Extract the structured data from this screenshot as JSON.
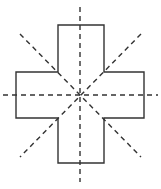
{
  "figure": {
    "shape_name": "cross",
    "background_color": "#ffffff",
    "canvas": {
      "width": 161,
      "height": 189
    },
    "center": {
      "x": 80,
      "y": 95
    },
    "outline": {
      "stroke_color": "#333333",
      "stroke_width": 1.4,
      "fill_color": "none",
      "points": "58,25 104,25 104,72 144,72 144,118 104,118 104,163 58,163 58,118 16,118 16,72 58,72",
      "vertices": [
        {
          "label": "top-left-arm-top",
          "x": 58,
          "y": 25
        },
        {
          "label": "top-right-arm-top",
          "x": 104,
          "y": 25
        },
        {
          "label": "upper-right-inner",
          "x": 104,
          "y": 72
        },
        {
          "label": "right-arm-top",
          "x": 144,
          "y": 72
        },
        {
          "label": "right-arm-bottom",
          "x": 144,
          "y": 118
        },
        {
          "label": "lower-right-inner",
          "x": 104,
          "y": 118
        },
        {
          "label": "bottom-right-arm-bottom",
          "x": 104,
          "y": 163
        },
        {
          "label": "bottom-left-arm-bottom",
          "x": 58,
          "y": 163
        },
        {
          "label": "lower-left-inner",
          "x": 58,
          "y": 118
        },
        {
          "label": "left-arm-bottom",
          "x": 16,
          "y": 118
        },
        {
          "label": "left-arm-top",
          "x": 16,
          "y": 72
        },
        {
          "label": "upper-left-inner",
          "x": 58,
          "y": 72
        }
      ]
    },
    "symmetry_lines": {
      "count": 4,
      "stroke_color": "#333333",
      "stroke_width": 1.4,
      "dash_pattern": "5,4",
      "lines": [
        {
          "name": "vertical-axis",
          "orientation": "vertical",
          "angle_deg": 90,
          "x1": 80,
          "y1": 7,
          "x2": 80,
          "y2": 182
        },
        {
          "name": "horizontal-axis",
          "orientation": "horizontal",
          "angle_deg": 0,
          "x1": 3,
          "y1": 95,
          "x2": 158,
          "y2": 95
        },
        {
          "name": "diagonal-axis-nwse",
          "orientation": "diagonal",
          "angle_deg": -45,
          "x1": 20,
          "y1": 34,
          "x2": 141,
          "y2": 157
        },
        {
          "name": "diagonal-axis-nesw",
          "orientation": "diagonal",
          "angle_deg": 45,
          "x1": 141,
          "y1": 34,
          "x2": 20,
          "y2": 157
        }
      ]
    }
  }
}
